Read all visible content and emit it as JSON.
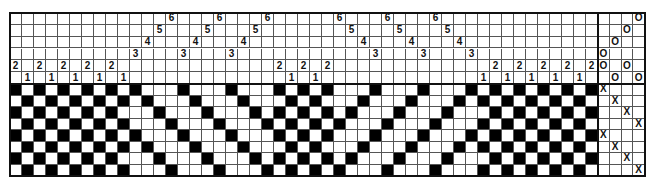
{
  "diagram": {
    "type": "weaving-draft",
    "title": "",
    "grid": {
      "columns": 49,
      "shafts": 6,
      "treadles": 4,
      "picks": 8
    },
    "threading": {
      "description": "Column index -> shaft number (rows top-to-bottom = shaft 6..1)",
      "shafts_by_column": [
        2,
        1,
        2,
        1,
        2,
        1,
        2,
        1,
        2,
        1,
        3,
        4,
        5,
        6,
        3,
        4,
        5,
        6,
        3,
        4,
        5,
        6,
        2,
        1,
        2,
        1,
        2,
        6,
        5,
        4,
        3,
        6,
        5,
        4,
        3,
        6,
        5,
        4,
        3,
        1,
        2,
        1,
        2,
        1,
        2,
        1,
        2,
        1,
        2
      ]
    },
    "tieup": {
      "description": "For each treadle (left to right), shafts tied; rendered as 'O'",
      "mark": "O",
      "treadles": [
        {
          "treadle": 1,
          "shafts": [
            3,
            2
          ]
        },
        {
          "treadle": 2,
          "shafts": [
            4,
            1
          ]
        },
        {
          "treadle": 3,
          "shafts": [
            5,
            2
          ]
        },
        {
          "treadle": 4,
          "shafts": [
            6,
            1
          ]
        }
      ]
    },
    "treadling": {
      "description": "For each pick (top to bottom), treadle pressed; rendered as 'X'",
      "mark": "X",
      "treadle_by_pick": [
        1,
        2,
        3,
        4,
        1,
        2,
        3,
        4
      ]
    },
    "colors": {
      "raised": "#000000",
      "empty": "#ffffff",
      "grid_line": "#555555",
      "frame": "#111111"
    }
  }
}
